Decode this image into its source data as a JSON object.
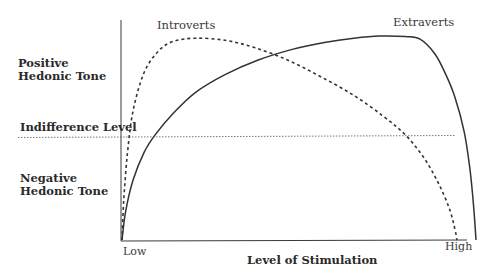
{
  "chart_data": {
    "type": "line",
    "title": "",
    "xlabel": "Level of Stimulation",
    "ylabel": "",
    "x_ticks": [
      "Low",
      "High"
    ],
    "y_region_labels": {
      "positive": "Positive Hedonic Tone",
      "indifference": "Indifference Level",
      "negative": "Negative Hedonic Tone"
    },
    "xlim": [
      0,
      1
    ],
    "ylim": [
      -1,
      1
    ],
    "indifference_level": 0,
    "series": [
      {
        "name": "Introverts",
        "style": "dashed",
        "points": [
          [
            0.0,
            -1.0
          ],
          [
            0.005,
            -0.6
          ],
          [
            0.015,
            -0.15
          ],
          [
            0.03,
            0.25
          ],
          [
            0.06,
            0.62
          ],
          [
            0.1,
            0.83
          ],
          [
            0.14,
            0.92
          ],
          [
            0.2,
            0.95
          ],
          [
            0.28,
            0.93
          ],
          [
            0.36,
            0.86
          ],
          [
            0.45,
            0.74
          ],
          [
            0.54,
            0.58
          ],
          [
            0.63,
            0.4
          ],
          [
            0.71,
            0.2
          ],
          [
            0.77,
            0.02
          ],
          [
            0.82,
            -0.2
          ],
          [
            0.86,
            -0.45
          ],
          [
            0.89,
            -0.7
          ],
          [
            0.905,
            -0.9
          ],
          [
            0.91,
            -1.0
          ]
        ]
      },
      {
        "name": "Extraverts",
        "style": "solid",
        "points": [
          [
            0.0,
            -1.0
          ],
          [
            0.01,
            -0.72
          ],
          [
            0.03,
            -0.42
          ],
          [
            0.06,
            -0.15
          ],
          [
            0.09,
            0.02
          ],
          [
            0.14,
            0.23
          ],
          [
            0.2,
            0.43
          ],
          [
            0.28,
            0.6
          ],
          [
            0.37,
            0.74
          ],
          [
            0.46,
            0.84
          ],
          [
            0.55,
            0.91
          ],
          [
            0.63,
            0.95
          ],
          [
            0.7,
            0.97
          ],
          [
            0.77,
            0.965
          ],
          [
            0.81,
            0.94
          ],
          [
            0.85,
            0.8
          ],
          [
            0.88,
            0.6
          ],
          [
            0.905,
            0.38
          ],
          [
            0.93,
            0.05
          ],
          [
            0.945,
            -0.3
          ],
          [
            0.955,
            -0.65
          ],
          [
            0.962,
            -1.0
          ]
        ]
      }
    ],
    "grid": false,
    "legend": "inline-labels"
  }
}
